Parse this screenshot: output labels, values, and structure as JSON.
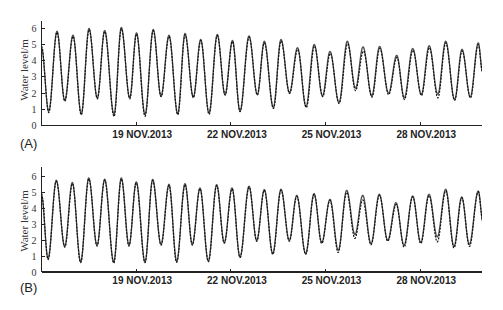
{
  "figure": {
    "panel_labels": [
      "(A)",
      "(B)"
    ]
  },
  "chart_data": [
    {
      "type": "line",
      "panel_label": "(A)",
      "title": "",
      "xlabel": "",
      "ylabel": "Water level/m",
      "x_unit": "day of November 2013",
      "xlim": [
        16,
        30
      ],
      "ylim": [
        0,
        6.5
      ],
      "grid": false,
      "legend": null,
      "xticks": [
        {
          "value": 19,
          "label": "19 NOV.2013"
        },
        {
          "value": 22,
          "label": "22 NOV.2013"
        },
        {
          "value": 25,
          "label": "25 NOV.2013"
        },
        {
          "value": 28,
          "label": "28 NOV.2013"
        }
      ],
      "yticks": [
        0,
        1,
        2,
        3,
        4,
        5,
        6
      ],
      "series": [
        {
          "name": "solid line",
          "style": "solid",
          "extrema": [
            [
              16.0,
              4.8
            ],
            [
              16.228,
              0.88
            ],
            [
              16.491,
              5.82
            ],
            [
              16.735,
              1.54
            ],
            [
              16.998,
              5.57
            ],
            [
              17.261,
              0.72
            ],
            [
              17.505,
              5.99
            ],
            [
              17.768,
              1.7
            ],
            [
              18.003,
              5.86
            ],
            [
              18.297,
              0.68
            ],
            [
              18.529,
              6.05
            ],
            [
              18.795,
              1.7
            ],
            [
              19.01,
              5.72
            ],
            [
              19.28,
              0.68
            ],
            [
              19.542,
              5.93
            ],
            [
              19.786,
              1.81
            ],
            [
              20.04,
              5.57
            ],
            [
              20.316,
              0.72
            ],
            [
              20.547,
              5.68
            ],
            [
              20.81,
              1.75
            ],
            [
              21.044,
              5.31
            ],
            [
              21.307,
              0.78
            ],
            [
              21.57,
              5.62
            ],
            [
              21.814,
              1.91
            ],
            [
              22.052,
              5.25
            ],
            [
              22.29,
              0.9
            ],
            [
              22.575,
              5.53
            ],
            [
              22.838,
              1.91
            ],
            [
              23.06,
              5.2
            ],
            [
              23.345,
              1.12
            ],
            [
              23.589,
              5.31
            ],
            [
              23.858,
              2.03
            ],
            [
              24.111,
              4.8
            ],
            [
              24.381,
              1.17
            ],
            [
              24.641,
              5.0
            ],
            [
              24.904,
              1.83
            ],
            [
              25.141,
              4.57
            ],
            [
              25.426,
              1.42
            ],
            [
              25.69,
              5.2
            ],
            [
              25.95,
              2.3
            ],
            [
              26.187,
              4.85
            ],
            [
              26.466,
              1.83
            ],
            [
              26.713,
              4.88
            ],
            [
              26.998,
              2.0
            ],
            [
              27.255,
              4.33
            ],
            [
              27.496,
              1.71
            ],
            [
              27.762,
              4.75
            ],
            [
              28.034,
              1.91
            ],
            [
              28.284,
              4.92
            ],
            [
              28.557,
              1.93
            ],
            [
              28.807,
              5.2
            ],
            [
              29.089,
              1.6
            ],
            [
              29.324,
              4.7
            ],
            [
              29.587,
              1.76
            ],
            [
              29.84,
              5.1
            ],
            [
              29.973,
              3.35
            ]
          ]
        },
        {
          "name": "dashed line",
          "style": "dashed",
          "extrema": [
            [
              16.0,
              4.9
            ],
            [
              16.23,
              0.8
            ],
            [
              16.49,
              5.75
            ],
            [
              16.74,
              1.5
            ],
            [
              17.0,
              5.5
            ],
            [
              17.26,
              0.65
            ],
            [
              17.51,
              5.92
            ],
            [
              17.77,
              1.65
            ],
            [
              18.0,
              5.8
            ],
            [
              18.3,
              0.55
            ],
            [
              18.53,
              5.98
            ],
            [
              18.8,
              1.65
            ],
            [
              19.01,
              5.65
            ],
            [
              19.28,
              0.57
            ],
            [
              19.54,
              5.85
            ],
            [
              19.79,
              1.78
            ],
            [
              20.04,
              5.5
            ],
            [
              20.32,
              0.66
            ],
            [
              20.55,
              5.6
            ],
            [
              20.81,
              1.72
            ],
            [
              21.05,
              5.25
            ],
            [
              21.31,
              0.68
            ],
            [
              21.57,
              5.55
            ],
            [
              21.82,
              1.88
            ],
            [
              22.05,
              5.18
            ],
            [
              22.29,
              0.85
            ],
            [
              22.58,
              5.45
            ],
            [
              22.84,
              1.88
            ],
            [
              23.06,
              5.1
            ],
            [
              23.35,
              1.05
            ],
            [
              23.59,
              5.22
            ],
            [
              23.86,
              1.98
            ],
            [
              24.12,
              4.7
            ],
            [
              24.39,
              1.1
            ],
            [
              24.65,
              4.9
            ],
            [
              24.91,
              1.78
            ],
            [
              25.15,
              4.45
            ],
            [
              25.43,
              1.35
            ],
            [
              25.7,
              5.05
            ],
            [
              25.95,
              2.15
            ],
            [
              26.2,
              4.6
            ],
            [
              26.47,
              1.75
            ],
            [
              26.72,
              4.75
            ],
            [
              27.0,
              1.9
            ],
            [
              27.26,
              4.2
            ],
            [
              27.5,
              1.6
            ],
            [
              27.77,
              4.65
            ],
            [
              28.04,
              1.85
            ],
            [
              28.29,
              4.8
            ],
            [
              28.56,
              1.7
            ],
            [
              28.81,
              5.1
            ],
            [
              29.09,
              1.55
            ],
            [
              29.33,
              4.6
            ],
            [
              29.59,
              1.7
            ],
            [
              29.84,
              5.0
            ],
            [
              29.973,
              3.3
            ]
          ]
        }
      ]
    },
    {
      "type": "line",
      "panel_label": "(B)",
      "title": "",
      "xlabel": "",
      "ylabel": "Water level/m",
      "x_unit": "day of November 2013",
      "xlim": [
        16,
        30
      ],
      "ylim": [
        0,
        6.5
      ],
      "grid": false,
      "legend": null,
      "xticks": [
        {
          "value": 19,
          "label": "19 NOV.2013"
        },
        {
          "value": 22,
          "label": "22 NOV.2013"
        },
        {
          "value": 25,
          "label": "25 NOV.2013"
        },
        {
          "value": 28,
          "label": "28 NOV.2013"
        }
      ],
      "yticks": [
        0,
        1,
        2,
        3,
        4,
        5,
        6
      ],
      "series": [
        {
          "name": "solid line",
          "style": "solid",
          "extrema": [
            [
              16.0,
              4.8
            ],
            [
              16.206,
              0.84
            ],
            [
              16.469,
              5.73
            ],
            [
              16.735,
              1.6
            ],
            [
              16.976,
              5.59
            ],
            [
              17.242,
              0.63
            ],
            [
              17.496,
              5.88
            ],
            [
              17.759,
              1.67
            ],
            [
              18.003,
              5.8
            ],
            [
              18.288,
              0.63
            ],
            [
              18.529,
              5.88
            ],
            [
              18.773,
              1.67
            ],
            [
              19.004,
              5.63
            ],
            [
              19.28,
              0.63
            ],
            [
              19.523,
              5.79
            ],
            [
              19.786,
              1.73
            ],
            [
              20.04,
              5.48
            ],
            [
              20.284,
              0.67
            ],
            [
              20.547,
              5.52
            ],
            [
              20.778,
              1.73
            ],
            [
              21.022,
              5.25
            ],
            [
              21.285,
              0.69
            ],
            [
              21.551,
              5.46
            ],
            [
              21.792,
              1.84
            ],
            [
              22.036,
              5.25
            ],
            [
              22.29,
              0.94
            ],
            [
              22.575,
              5.36
            ],
            [
              22.819,
              1.98
            ],
            [
              23.06,
              5.15
            ],
            [
              23.326,
              1.15
            ],
            [
              23.589,
              5.17
            ],
            [
              23.852,
              1.98
            ],
            [
              24.086,
              4.79
            ],
            [
              24.371,
              1.15
            ],
            [
              24.635,
              4.9
            ],
            [
              24.878,
              1.84
            ],
            [
              25.141,
              4.54
            ],
            [
              25.404,
              1.36
            ],
            [
              25.67,
              5.1
            ],
            [
              25.933,
              2.34
            ],
            [
              26.178,
              4.79
            ],
            [
              26.441,
              1.77
            ],
            [
              26.704,
              4.86
            ],
            [
              26.97,
              1.98
            ],
            [
              27.233,
              4.33
            ],
            [
              27.486,
              1.67
            ],
            [
              27.762,
              4.75
            ],
            [
              28.015,
              1.84
            ],
            [
              28.278,
              4.86
            ],
            [
              28.541,
              2.19
            ],
            [
              28.807,
              5.17
            ],
            [
              29.07,
              1.6
            ],
            [
              29.314,
              4.69
            ],
            [
              29.555,
              1.73
            ],
            [
              29.84,
              5.06
            ],
            [
              29.989,
              3.13
            ]
          ]
        },
        {
          "name": "dashed line",
          "style": "dashed",
          "extrema": [
            [
              16.0,
              4.9
            ],
            [
              16.21,
              0.78
            ],
            [
              16.47,
              5.68
            ],
            [
              16.74,
              1.55
            ],
            [
              16.98,
              5.52
            ],
            [
              17.24,
              0.58
            ],
            [
              17.5,
              5.82
            ],
            [
              17.76,
              1.62
            ],
            [
              18.0,
              5.74
            ],
            [
              18.29,
              0.55
            ],
            [
              18.53,
              5.82
            ],
            [
              18.77,
              1.62
            ],
            [
              19.0,
              5.58
            ],
            [
              19.28,
              0.58
            ],
            [
              19.52,
              5.72
            ],
            [
              19.79,
              1.68
            ],
            [
              20.04,
              5.42
            ],
            [
              20.28,
              0.6
            ],
            [
              20.55,
              5.46
            ],
            [
              20.78,
              1.68
            ],
            [
              21.02,
              5.2
            ],
            [
              21.29,
              0.64
            ],
            [
              21.55,
              5.4
            ],
            [
              21.79,
              1.8
            ],
            [
              22.04,
              5.2
            ],
            [
              22.29,
              0.9
            ],
            [
              22.58,
              5.3
            ],
            [
              22.82,
              1.92
            ],
            [
              23.06,
              5.1
            ],
            [
              23.33,
              1.1
            ],
            [
              23.59,
              5.12
            ],
            [
              23.85,
              1.92
            ],
            [
              24.09,
              4.72
            ],
            [
              24.37,
              1.1
            ],
            [
              24.64,
              4.85
            ],
            [
              24.88,
              1.78
            ],
            [
              25.14,
              4.48
            ],
            [
              25.4,
              1.22
            ],
            [
              25.67,
              4.98
            ],
            [
              25.93,
              2.1
            ],
            [
              26.18,
              4.5
            ],
            [
              26.44,
              1.7
            ],
            [
              26.71,
              4.8
            ],
            [
              26.97,
              1.92
            ],
            [
              27.24,
              4.22
            ],
            [
              27.49,
              1.55
            ],
            [
              27.76,
              4.7
            ],
            [
              28.02,
              1.78
            ],
            [
              28.28,
              4.78
            ],
            [
              28.54,
              1.88
            ],
            [
              28.81,
              5.08
            ],
            [
              29.07,
              1.5
            ],
            [
              29.32,
              4.64
            ],
            [
              29.56,
              1.6
            ],
            [
              29.84,
              5.02
            ],
            [
              29.989,
              3.1
            ]
          ]
        }
      ]
    }
  ]
}
